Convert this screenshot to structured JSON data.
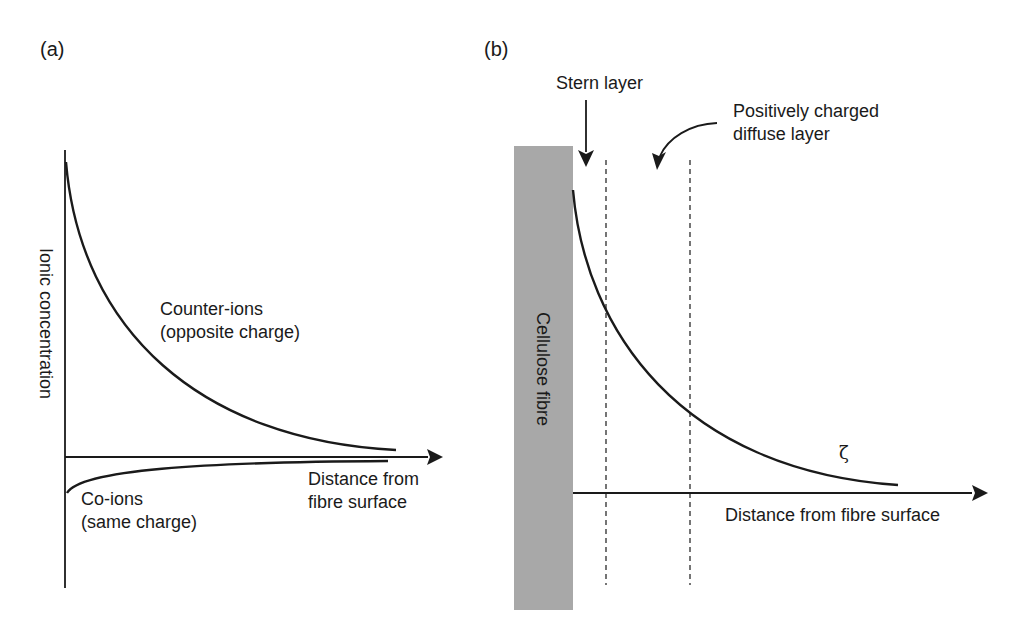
{
  "panel_a": {
    "label": "(a)",
    "y_axis_label": "Ionic concentration",
    "x_axis_label_line1": "Distance from",
    "x_axis_label_line2": "fibre surface",
    "counter_ions_line1": "Counter-ions",
    "counter_ions_line2": "(opposite charge)",
    "co_ions_line1": "Co-ions",
    "co_ions_line2": "(same charge)"
  },
  "panel_b": {
    "label": "(b)",
    "fibre_label": "Cellulose fibre",
    "stern_layer_label": "Stern layer",
    "diffuse_layer_line1": "Positively charged",
    "diffuse_layer_line2": "diffuse layer",
    "zeta_symbol": "ζ",
    "x_axis_label": "Distance from fibre surface"
  },
  "colors": {
    "line": "#1a1a1a",
    "fibre_fill": "#a8a8a8",
    "background": "#ffffff"
  }
}
